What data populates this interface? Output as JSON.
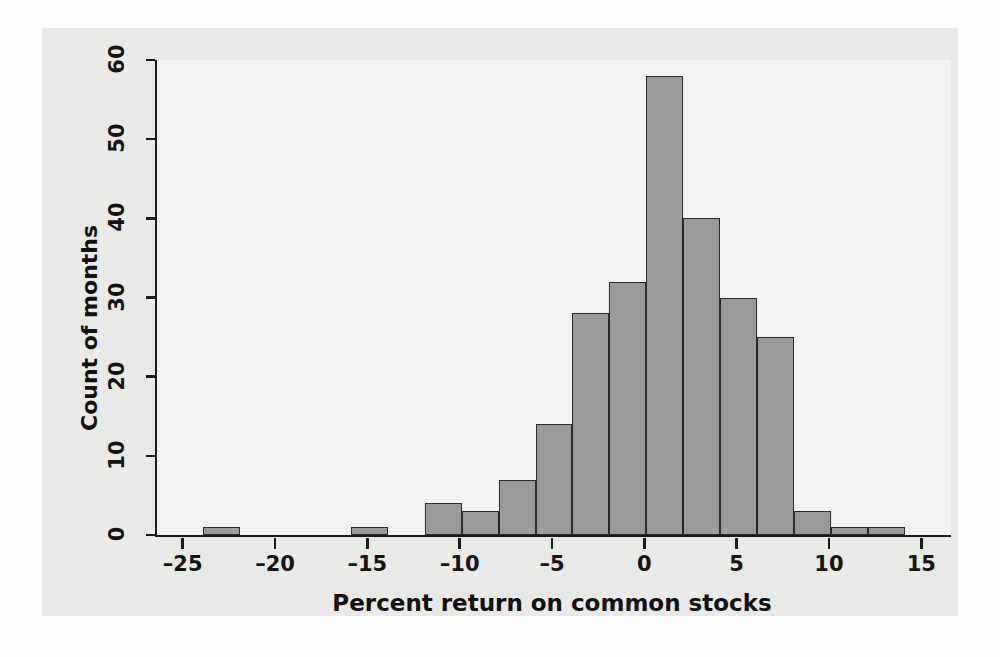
{
  "figure": {
    "background_color": "#fcfcfc",
    "panel_color": "#e9e9e7",
    "plot_area_color": "#f2f2f0",
    "bar_fill_color": "#9a9a9a",
    "bar_border_color": "#2a2a2a",
    "axis_color": "#1a1a1a"
  },
  "chart_data": {
    "type": "bar",
    "title": "",
    "subtitle": "",
    "xlabel": "Percent return on common stocks",
    "ylabel": "Count of months",
    "xlim": [
      -26.5,
      16.5
    ],
    "ylim": [
      0,
      60
    ],
    "grid": false,
    "legend": null,
    "bin_width": 2,
    "categories": [
      "-24 to -22",
      "-22 to -20",
      "-20 to -18",
      "-18 to -16",
      "-16 to -14",
      "-14 to -12",
      "-12 to -10",
      "-10 to -8",
      "-8 to -6",
      "-6 to -4",
      "-4 to -2",
      "-2 to 0",
      "0 to 2",
      "2 to 4",
      "4 to 6",
      "6 to 8",
      "8 to 10",
      "10 to 12",
      "12 to 14"
    ],
    "bin_starts": [
      -24,
      -22,
      -20,
      -18,
      -16,
      -14,
      -12,
      -10,
      -8,
      -6,
      -4,
      -2,
      0,
      2,
      4,
      6,
      8,
      10,
      12
    ],
    "values": [
      1,
      0,
      0,
      0,
      1,
      0,
      4,
      3,
      7,
      14,
      28,
      32,
      58,
      40,
      30,
      25,
      3,
      1,
      1
    ],
    "x_ticks": [
      -25,
      -20,
      -15,
      -10,
      -5,
      0,
      5,
      10,
      15
    ],
    "x_tick_labels": [
      "–25",
      "–20",
      "–15",
      "–10",
      "–5",
      "0",
      "5",
      "10",
      "15"
    ],
    "y_ticks": [
      0,
      10,
      20,
      30,
      40,
      50,
      60
    ],
    "y_tick_labels": [
      "0",
      "10",
      "20",
      "30",
      "40",
      "50",
      "60"
    ]
  }
}
